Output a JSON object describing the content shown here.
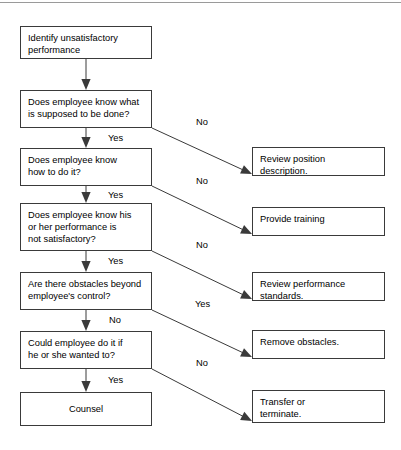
{
  "diagram": {
    "type": "flowchart",
    "background_color": "#ffffff",
    "line_color": "#3a3a3a",
    "text_color": "#000000",
    "top_rule_color": "#9a9a9a"
  },
  "left_column": [
    {
      "id": "start",
      "text": "Identify unsatisfactory\nperformance",
      "x": 20,
      "y": 26,
      "w": 132,
      "h": 33,
      "align": "left"
    },
    {
      "id": "q1",
      "text": "Does employee know what\nis supposed to be done?",
      "x": 20,
      "y": 90,
      "w": 132,
      "h": 38,
      "align": "left"
    },
    {
      "id": "q2",
      "text": "Does employee know\nhow to do it?",
      "x": 20,
      "y": 148,
      "w": 132,
      "h": 38,
      "align": "left"
    },
    {
      "id": "q3",
      "text": "Does employee know his\nor her performance is\nnot satisfactory?",
      "x": 20,
      "y": 203,
      "w": 132,
      "h": 48,
      "align": "left"
    },
    {
      "id": "q4",
      "text": "Are there obstacles beyond\nemployee's control?",
      "x": 20,
      "y": 272,
      "w": 132,
      "h": 38,
      "align": "left"
    },
    {
      "id": "q5",
      "text": "Could employee do it if\nhe or she wanted to?",
      "x": 20,
      "y": 331,
      "w": 132,
      "h": 38,
      "align": "left"
    },
    {
      "id": "counsel",
      "text": "Counsel",
      "x": 20,
      "y": 392,
      "w": 132,
      "h": 34,
      "align": "center"
    }
  ],
  "right_column": [
    {
      "id": "r1",
      "text": "Review position\ndescription.",
      "x": 252,
      "y": 147,
      "w": 133,
      "h": 29,
      "align": "left"
    },
    {
      "id": "r2",
      "text": "Provide training",
      "x": 252,
      "y": 207,
      "w": 133,
      "h": 29,
      "align": "left"
    },
    {
      "id": "r3",
      "text": "Review performance\nstandards.",
      "x": 252,
      "y": 272,
      "w": 133,
      "h": 29,
      "align": "left"
    },
    {
      "id": "r4",
      "text": "Remove obstacles.",
      "x": 252,
      "y": 330,
      "w": 133,
      "h": 29,
      "align": "left"
    },
    {
      "id": "r5",
      "text": "Transfer or\nterminate.",
      "x": 252,
      "y": 390,
      "w": 133,
      "h": 33,
      "align": "left"
    }
  ],
  "edge_labels": [
    {
      "id": "q1-down",
      "text": "Yes",
      "x": 108,
      "y": 133
    },
    {
      "id": "q1-diag",
      "text": "No",
      "x": 196,
      "y": 117
    },
    {
      "id": "q2-down",
      "text": "Yes",
      "x": 108,
      "y": 190
    },
    {
      "id": "q2-diag",
      "text": "No",
      "x": 196,
      "y": 176
    },
    {
      "id": "q3-down",
      "text": "Yes",
      "x": 108,
      "y": 256
    },
    {
      "id": "q3-diag",
      "text": "No",
      "x": 196,
      "y": 240
    },
    {
      "id": "q4-down",
      "text": "No",
      "x": 109,
      "y": 315
    },
    {
      "id": "q4-diag",
      "text": "Yes",
      "x": 195,
      "y": 299
    },
    {
      "id": "q5-down",
      "text": "Yes",
      "x": 108,
      "y": 375
    },
    {
      "id": "q5-diag",
      "text": "No",
      "x": 196,
      "y": 358
    }
  ],
  "connectors": {
    "vertical": [
      {
        "id": "start-to-q1",
        "x": 86,
        "y1": 59,
        "y2": 90
      },
      {
        "id": "q1-to-q2",
        "x": 86,
        "y1": 128,
        "y2": 148
      },
      {
        "id": "q2-to-q3",
        "x": 86,
        "y1": 186,
        "y2": 203
      },
      {
        "id": "q3-to-q4",
        "x": 86,
        "y1": 251,
        "y2": 272
      },
      {
        "id": "q4-to-q5",
        "x": 86,
        "y1": 310,
        "y2": 331
      },
      {
        "id": "q5-to-counsel",
        "x": 86,
        "y1": 369,
        "y2": 392
      }
    ],
    "diagonal": [
      {
        "id": "q1-to-r1",
        "x1": 152,
        "y1": 128,
        "x2": 252,
        "y2": 174
      },
      {
        "id": "q2-to-r2",
        "x1": 152,
        "y1": 186,
        "x2": 252,
        "y2": 234
      },
      {
        "id": "q3-to-r3",
        "x1": 152,
        "y1": 251,
        "x2": 252,
        "y2": 299
      },
      {
        "id": "q4-to-r4",
        "x1": 152,
        "y1": 310,
        "x2": 252,
        "y2": 357
      },
      {
        "id": "q5-to-r5",
        "x1": 152,
        "y1": 369,
        "x2": 252,
        "y2": 421
      }
    ]
  }
}
